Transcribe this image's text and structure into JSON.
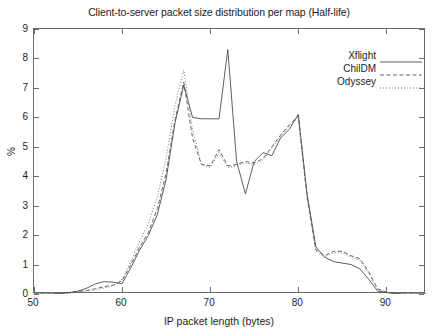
{
  "chart_data": {
    "type": "line",
    "title": "Client-to-server packet size distribution per map (Half-life)",
    "xlabel": "IP packet length (bytes)",
    "ylabel": "%",
    "xlim": [
      50,
      94.5
    ],
    "ylim": [
      0,
      9
    ],
    "xticks": [
      50,
      60,
      70,
      80,
      90
    ],
    "yticks": [
      0,
      1,
      2,
      3,
      4,
      5,
      6,
      7,
      8,
      9
    ],
    "grid": false,
    "legend_position": "top-right",
    "series": [
      {
        "name": "Xflight",
        "style": "solid",
        "color": "#4d4d4d",
        "x": [
          50,
          52,
          53,
          54,
          55,
          56,
          57,
          58,
          59,
          60,
          61,
          62,
          63,
          64,
          65,
          66,
          67,
          68,
          69,
          70,
          71,
          72,
          73,
          74,
          75,
          76,
          77,
          78,
          79,
          80,
          81,
          82,
          83,
          84,
          85,
          86,
          87,
          88,
          89,
          90,
          91,
          92,
          94.5
        ],
        "y": [
          0,
          0,
          0.02,
          0.05,
          0.1,
          0.2,
          0.35,
          0.42,
          0.4,
          0.35,
          0.9,
          1.5,
          2.0,
          2.7,
          3.9,
          5.8,
          7.1,
          6.0,
          5.95,
          5.95,
          5.95,
          8.3,
          4.5,
          3.4,
          4.5,
          4.8,
          4.7,
          5.3,
          5.6,
          6.1,
          3.4,
          1.6,
          1.25,
          1.1,
          1.05,
          1.0,
          0.85,
          0.5,
          0.1,
          0.05,
          0.02,
          0,
          0
        ]
      },
      {
        "name": "ChilDM",
        "style": "dashed",
        "color": "#555555",
        "x": [
          50,
          52,
          53,
          54,
          55,
          56,
          57,
          58,
          59,
          60,
          61,
          62,
          63,
          64,
          65,
          66,
          67,
          68,
          69,
          70,
          71,
          72,
          73,
          74,
          75,
          76,
          77,
          78,
          79,
          80,
          81,
          82,
          83,
          84,
          85,
          86,
          87,
          88,
          89,
          90,
          91,
          92,
          94.5
        ],
        "y": [
          0,
          0,
          0.02,
          0.04,
          0.08,
          0.12,
          0.18,
          0.25,
          0.3,
          0.45,
          1.0,
          1.6,
          2.1,
          2.9,
          4.1,
          5.9,
          7.2,
          5.3,
          4.4,
          4.35,
          4.9,
          4.35,
          4.4,
          4.5,
          4.45,
          4.6,
          5.0,
          5.4,
          5.75,
          6.05,
          3.3,
          1.5,
          1.3,
          1.45,
          1.45,
          1.3,
          1.2,
          0.75,
          0.18,
          0.06,
          0.02,
          0,
          0
        ]
      },
      {
        "name": "Odyssey",
        "style": "dotted",
        "color": "#6a6a6a",
        "x": [
          50,
          52,
          53,
          54,
          55,
          56,
          57,
          58,
          59,
          60,
          61,
          62,
          63,
          64,
          65,
          66,
          67,
          68,
          69,
          70,
          71,
          72,
          73,
          74,
          75,
          76,
          77,
          78,
          79,
          80,
          81,
          82,
          83,
          84,
          85,
          86,
          87,
          88,
          89,
          90,
          91,
          92,
          94.5
        ],
        "y": [
          0,
          0,
          0.01,
          0.03,
          0.06,
          0.1,
          0.15,
          0.2,
          0.28,
          0.5,
          1.1,
          1.8,
          2.4,
          3.3,
          4.6,
          6.4,
          7.6,
          5.6,
          4.4,
          4.3,
          4.8,
          4.3,
          4.35,
          4.45,
          4.4,
          4.55,
          4.95,
          5.35,
          5.7,
          6.0,
          3.25,
          1.45,
          1.25,
          1.4,
          1.4,
          1.25,
          1.15,
          0.7,
          0.15,
          0.05,
          0.02,
          0,
          0
        ]
      }
    ]
  },
  "legend": {
    "items": [
      {
        "label": "Xflight"
      },
      {
        "label": "ChilDM"
      },
      {
        "label": "Odyssey"
      }
    ]
  }
}
